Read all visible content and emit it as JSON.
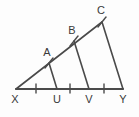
{
  "figure": {
    "background_color": "#fdfdfd",
    "line_color": "#4a4a4a",
    "label_color": "#3a3a3a",
    "labels": {
      "X": "X",
      "U": "U",
      "V": "V",
      "Y": "Y",
      "A": "A",
      "B": "B",
      "C": "C"
    },
    "points": {
      "X": {
        "x": 16,
        "y": 89
      },
      "U": {
        "x": 57,
        "y": 89
      },
      "V": {
        "x": 89,
        "y": 89
      },
      "Y": {
        "x": 123,
        "y": 89
      },
      "A": {
        "x": 49,
        "y": 63
      },
      "B": {
        "x": 74,
        "y": 41
      },
      "C": {
        "x": 102,
        "y": 22
      }
    },
    "label_positions": {
      "X": {
        "x": 15,
        "y": 103
      },
      "U": {
        "x": 57,
        "y": 103
      },
      "V": {
        "x": 89,
        "y": 103
      },
      "Y": {
        "x": 123,
        "y": 103
      },
      "A": {
        "x": 47,
        "y": 56
      },
      "B": {
        "x": 72,
        "y": 34
      },
      "C": {
        "x": 101,
        "y": 14
      }
    },
    "segments": [
      {
        "name": "base-XY",
        "from": "X",
        "to": "Y"
      },
      {
        "name": "hypotenuse-XC",
        "from": "X",
        "to": "C"
      },
      {
        "name": "transversal-AU",
        "from": "A",
        "to": "U"
      },
      {
        "name": "transversal-BV",
        "from": "B",
        "to": "V"
      },
      {
        "name": "side-CY",
        "from": "C",
        "to": "Y"
      }
    ],
    "base_tick_positions": [
      36,
      70,
      104,
      113
    ],
    "hypotenuse_tick_points": [
      "A",
      "B",
      "C"
    ]
  }
}
